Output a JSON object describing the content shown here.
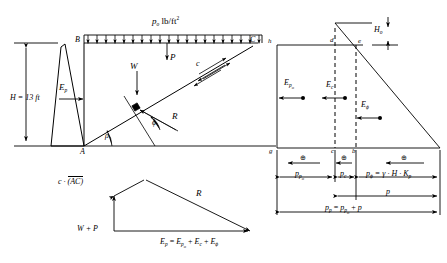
{
  "figure": {
    "stroke_color": "#000000",
    "background_color": "#ffffff"
  },
  "left_diagram": {
    "name": "retaining-wall-wedge",
    "height_label": "H = 13 ft",
    "surcharge_label": "p",
    "surcharge_sub": "o",
    "surcharge_units": "lb/ft",
    "surcharge_exp": "2",
    "point_B": "B",
    "point_C": "C",
    "point_A": "A",
    "force_Ep": "E",
    "force_Ep_sub": "p",
    "force_W": "W",
    "force_P": "P",
    "force_R": "R",
    "cohesion": "c",
    "angle_rho": "ρ",
    "angle_phi": "ϕ"
  },
  "force_polygon": {
    "name": "force-polygon",
    "cohesion_term": "c ·",
    "cohesion_ac": "(AC)",
    "weight_term": "W + P",
    "resultant": "R",
    "equation_lhs": "E",
    "equation_lhs_sub": "p",
    "equation_eq": "=",
    "equation_t1": "E",
    "equation_t1_sub": "p",
    "equation_t1_sub2": "o",
    "equation_plus1": "+",
    "equation_t2": "E",
    "equation_t2_sub": "c",
    "equation_plus2": "+",
    "equation_t3": "E",
    "equation_t3_sub": "ϕ"
  },
  "right_diagram": {
    "name": "pressure-distribution",
    "vertex_h": "h",
    "vertex_d": "d",
    "vertex_e": "e",
    "vertex_g": "g",
    "vertex_c": "c",
    "vertex_b": "b",
    "depth_H0": "H",
    "depth_H0_sub": "o",
    "force_Epo": "E",
    "force_Epo_sub": "p",
    "force_Epo_sub2": "o",
    "force_Ec": "E",
    "force_Ec_sub": "c",
    "force_Ephi": "E",
    "force_Ephi_sub": "ϕ",
    "press_ppo": "p",
    "press_ppo_sub": "p",
    "press_ppo_sub2": "o",
    "press_pc": "p",
    "press_pc_sub": "c",
    "press_pphi": "p",
    "press_pphi_sub": "ϕ",
    "press_pphi_eq": "= γ · H · K",
    "press_pphi_eq_sub": "p",
    "press_p": "p",
    "press_pp": "p",
    "press_pp_sub": "p",
    "press_pp_eq": "=",
    "press_pp_t1": "p",
    "press_pp_t1_sub": "p",
    "press_pp_t1_sub2": "o",
    "press_pp_plus": "+",
    "press_pp_t2": "p",
    "plus_marker": "⊕"
  }
}
